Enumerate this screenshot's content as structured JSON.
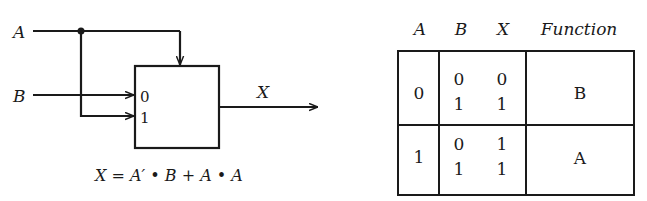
{
  "mux_diagram": {
    "input_a_label": "A",
    "input_b_label": "B",
    "output_label": "X",
    "data_input_0_label": "0",
    "data_input_1_label": "1",
    "equation": "X = A′ • B + A • A",
    "colors": {
      "stroke": "#1a1a1a",
      "background": "#ffffff"
    }
  },
  "truth_table": {
    "headers": [
      "A",
      "B",
      "X",
      "Function"
    ],
    "groups": [
      {
        "a": "0",
        "rows": [
          {
            "b": "0",
            "x": "0"
          },
          {
            "b": "1",
            "x": "1"
          }
        ],
        "function": "B"
      },
      {
        "a": "1",
        "rows": [
          {
            "b": "0",
            "x": "1"
          },
          {
            "b": "1",
            "x": "1"
          }
        ],
        "function": "A"
      }
    ]
  }
}
